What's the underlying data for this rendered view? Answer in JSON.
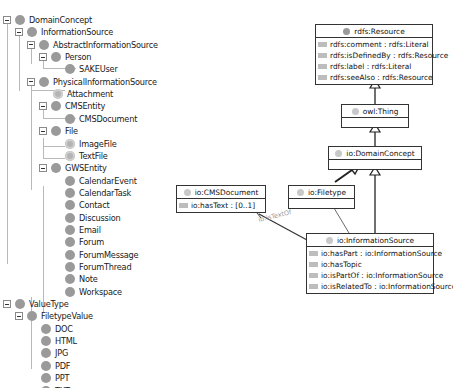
{
  "tree": {
    "nodes": [
      {
        "label": "DomainConcept",
        "level": 0,
        "expanded": true
      },
      {
        "label": "InformationSource",
        "level": 1,
        "expanded": true
      },
      {
        "label": "AbstractInformationSource",
        "level": 2,
        "expanded": true
      },
      {
        "label": "Person",
        "level": 3,
        "expanded": true
      },
      {
        "label": "SAKEUser",
        "level": 4,
        "expanded": null
      },
      {
        "label": "PhysicalInformationSource",
        "level": 2,
        "expanded": true
      },
      {
        "label": "Attachment",
        "level": 3,
        "expanded": null
      },
      {
        "label": "CMSEntity",
        "level": 3,
        "expanded": true
      },
      {
        "label": "CMSDocument",
        "level": 4,
        "expanded": null
      },
      {
        "label": "File",
        "level": 3,
        "expanded": true
      },
      {
        "label": "ImageFile",
        "level": 4,
        "expanded": null
      },
      {
        "label": "TextFile",
        "level": 4,
        "expanded": null
      },
      {
        "label": "GWSEntity",
        "level": 3,
        "expanded": true
      },
      {
        "label": "CalendarEvent",
        "level": 4,
        "expanded": null
      },
      {
        "label": "CalendarTask",
        "level": 4,
        "expanded": null
      },
      {
        "label": "Contact",
        "level": 4,
        "expanded": null
      },
      {
        "label": "Discussion",
        "level": 4,
        "expanded": null
      },
      {
        "label": "Email",
        "level": 4,
        "expanded": null
      },
      {
        "label": "Forum",
        "level": 4,
        "expanded": null
      },
      {
        "label": "ForumMessage",
        "level": 4,
        "expanded": null
      },
      {
        "label": "ForumThread",
        "level": 4,
        "expanded": null
      },
      {
        "label": "Note",
        "level": 4,
        "expanded": null
      },
      {
        "label": "Workspace",
        "level": 4,
        "expanded": null
      },
      {
        "label": "ValueType",
        "level": 0,
        "expanded": true
      },
      {
        "label": "FiletypeValue",
        "level": 1,
        "expanded": true
      },
      {
        "label": "DOC",
        "level": 2,
        "expanded": null
      },
      {
        "label": "HTML",
        "level": 2,
        "expanded": null
      },
      {
        "label": "JPG",
        "level": 2,
        "expanded": null
      },
      {
        "label": "PDF",
        "level": 2,
        "expanded": null
      },
      {
        "label": "PPT",
        "level": 2,
        "expanded": null
      },
      {
        "label": "TXT",
        "level": 2,
        "expanded": null
      }
    ]
  },
  "diagram": {
    "classes": {
      "resource": {
        "name": "rdfs:Resource",
        "attributes": [
          "rdfs:comment : rdfs:Literal",
          "rdfs:isDefinedBy : rdfs:Resource",
          "rdfs:label : rdfs:Literal",
          "rdfs:seeAlso : rdfs:Resource"
        ]
      },
      "thing": {
        "name": "owl:Thing",
        "attributes": []
      },
      "domain_concept": {
        "name": "io:DomainConcept",
        "attributes": []
      },
      "cms_document": {
        "name": "io:CMSDocument",
        "attributes": [
          "io:hasText : [0..1]"
        ]
      },
      "filetype": {
        "name": "io:Filetype",
        "attributes": []
      },
      "information_source": {
        "name": "io:InformationSource",
        "attributes": [
          "io:hasPart : io:InformationSource",
          "io:hasTopic",
          "io:isPartOf : io:InformationSource",
          "io:isRelatedTo : io:InformationSource"
        ]
      }
    },
    "edge_labels": {
      "text_of": "io:isTextOf"
    }
  }
}
